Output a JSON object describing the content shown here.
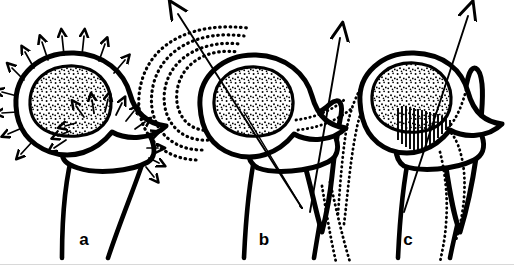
{
  "figure": {
    "background_color": "#ffffff",
    "ink_color": "#000000",
    "width": 514,
    "height": 267,
    "panel_count": 3
  },
  "panels": [
    {
      "id": "a",
      "label": "a",
      "label_x": 84,
      "label_y": 245,
      "description": "Normal hip: acetabulum and femoral head with radiating growth-pressure arrows",
      "features": {
        "acetabulum_fill": "stipple",
        "arrows": "many-small-radiating",
        "arrow_count_outer": 11,
        "arrow_count_head": 13,
        "contours": "none",
        "hatching": "none",
        "force_vectors": 0
      }
    },
    {
      "id": "b",
      "label": "b",
      "label_x": 264,
      "label_y": 245,
      "description": "Hip with two resultant force vectors and concentric dotted expansion contours",
      "features": {
        "acetabulum_fill": "stipple",
        "arrows": "two-large-vectors",
        "contours": "concentric-dotted-arcs",
        "contour_count_medial": 4,
        "contour_count_lateral": 3,
        "hatching": "none",
        "force_vectors": 2
      }
    },
    {
      "id": "c",
      "label": "c",
      "label_x": 408,
      "label_y": 245,
      "description": "Hip with hatched joint fusion zone and single lateral force vector",
      "features": {
        "acetabulum_fill": "stipple",
        "arrows": "one-large-vector",
        "contours": "single-dotted-outline",
        "hatching": "vertical-dense",
        "hatch_line_count": 14,
        "force_vectors": 1
      }
    }
  ],
  "legend": {
    "stipple_meaning": "cancellous bone / cartilage",
    "small_arrow_meaning": "growth pressure direction",
    "large_arrow_meaning": "resultant joint force vector",
    "dotted_contour_meaning": "remodelling / expansion contour",
    "hatch_meaning": "fusion / bony contact zone"
  }
}
